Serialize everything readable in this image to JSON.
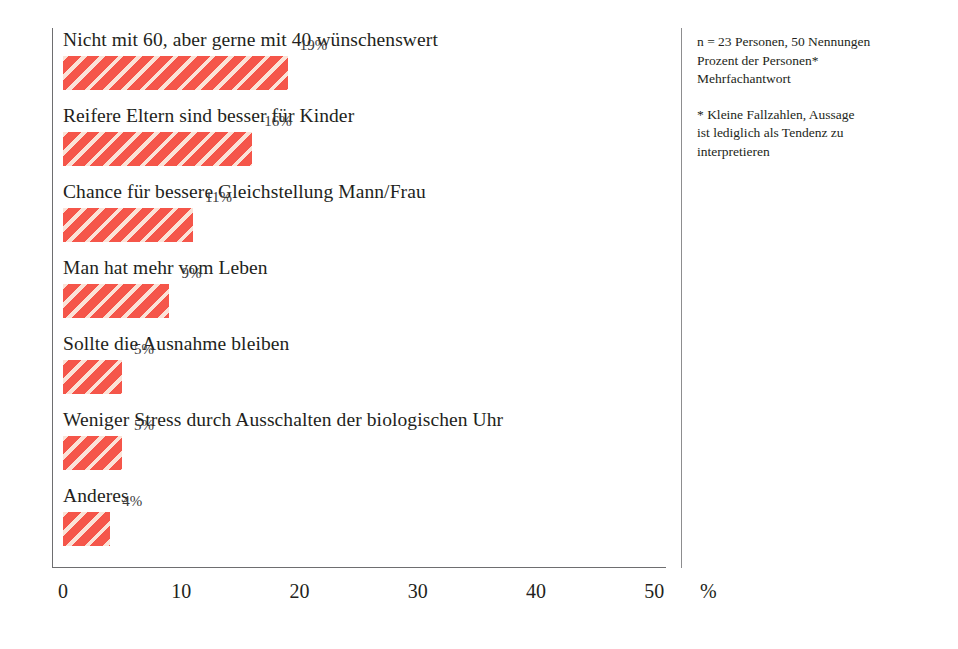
{
  "chart_data": {
    "type": "bar",
    "orientation": "horizontal",
    "title": "",
    "subtitle": "",
    "xlabel": "%",
    "ylabel": "",
    "xlim": [
      0,
      50
    ],
    "xticks": [
      0,
      10,
      20,
      30,
      40,
      50
    ],
    "xtick_labels": [
      "0",
      "10",
      "20",
      "30",
      "40",
      "50"
    ],
    "grid": false,
    "legend": false,
    "bar_color": "#f5564a",
    "bar_hatch_color": "#fbe3d8",
    "bar_hatch": "diagonal-stripes",
    "categories": [
      "Nicht mit 60, aber gerne mit 40 wünschenswert",
      "Reifere Eltern sind besser für Kinder",
      "Chance für bessere Gleichstellung Mann/Frau",
      "Man hat mehr vom Leben",
      "Sollte die Ausnahme bleiben",
      "Weniger Stress durch Ausschalten der biologischen Uhr",
      "Anderes"
    ],
    "values": [
      19,
      16,
      11,
      9,
      5,
      5,
      4
    ],
    "value_labels": [
      "19%",
      "16%",
      "11%",
      "9%",
      "5%",
      "5%",
      "4%"
    ]
  },
  "notes": {
    "primary": [
      "n = 23 Personen, 50 Nennungen",
      "Prozent der Personen*",
      "Mehrfachantwort"
    ],
    "footnote": [
      "* Kleine Fallzahlen, Aussage",
      "ist lediglich als Tendenz zu",
      "interpretieren"
    ]
  }
}
